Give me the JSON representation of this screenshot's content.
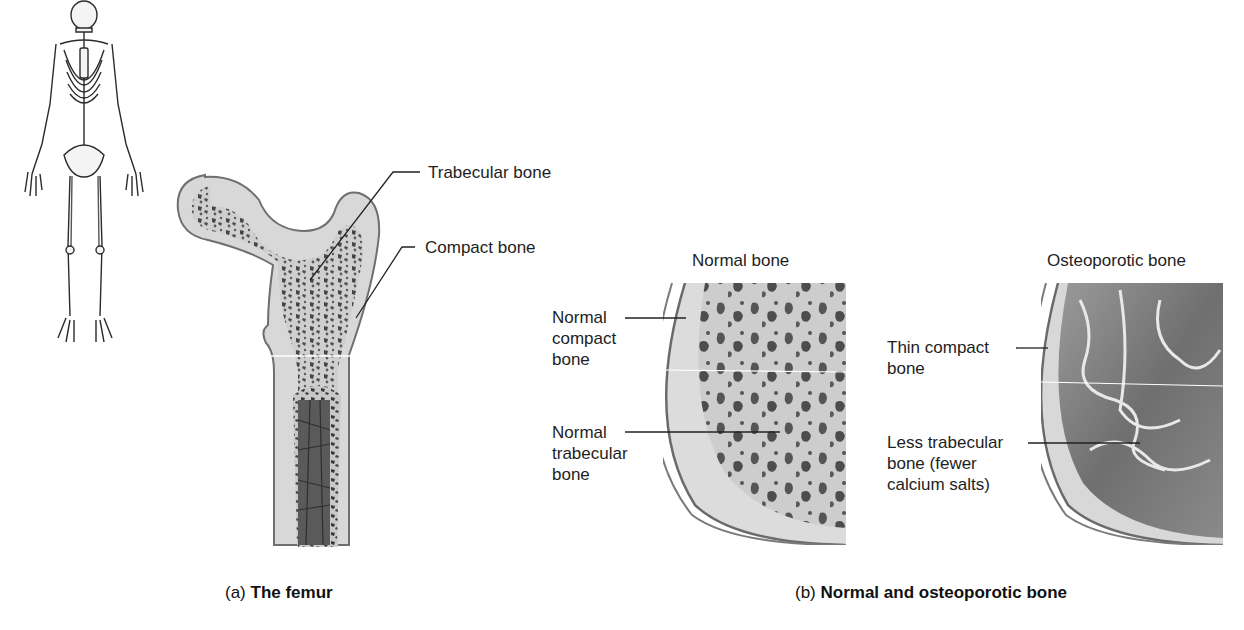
{
  "figure": {
    "panel_a": {
      "caption_prefix": "(a)",
      "caption_bold": "The femur",
      "labels": {
        "trabecular": "Trabecular bone",
        "compact": "Compact bone"
      }
    },
    "panel_b": {
      "caption_prefix": "(b)",
      "caption_bold": "Normal and osteoporotic bone",
      "normal": {
        "title": "Normal bone",
        "compact_label": [
          "Normal",
          "compact",
          "bone"
        ],
        "trabecular_label": [
          "Normal",
          "trabecular",
          "bone"
        ]
      },
      "osteoporotic": {
        "title": "Osteoporotic bone",
        "compact_label": [
          "Thin compact",
          "bone"
        ],
        "trabecular_label": [
          "Less trabecular",
          "bone (fewer",
          "calcium salts)"
        ]
      }
    },
    "colors": {
      "bone_light": "#d9d9d9",
      "bone_mid": "#c4c4c4",
      "cavity_dark": "#4a4a4a",
      "outline": "#6e6e6e",
      "leader_line": "#222222"
    }
  }
}
